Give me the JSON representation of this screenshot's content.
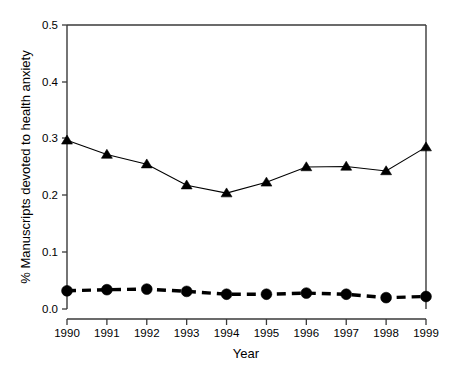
{
  "chart_data": {
    "type": "line",
    "title": "",
    "subtitle": "",
    "xlabel": "Year",
    "ylabel": "% Manuscripts devoted to health anxiety",
    "categories": [
      "1990",
      "1991",
      "1992",
      "1993",
      "1994",
      "1995",
      "1996",
      "1997",
      "1998",
      "1999"
    ],
    "x": [
      1990,
      1991,
      1992,
      1993,
      1994,
      1995,
      1996,
      1997,
      1998,
      1999
    ],
    "xlim": [
      1990,
      1999
    ],
    "ylim": [
      0.0,
      0.5
    ],
    "ytick_labels": [
      "0.0",
      "0.1",
      "0.2",
      "0.3",
      "0.4",
      "0.5"
    ],
    "ytick_values": [
      0.0,
      0.1,
      0.2,
      0.3,
      0.4,
      0.5
    ],
    "xtick_labels": [
      "1990",
      "1991",
      "1992",
      "1993",
      "1994",
      "1995",
      "1996",
      "1997",
      "1998",
      "1999"
    ],
    "grid": false,
    "legend": "none",
    "series": [
      {
        "name": "triangle-series",
        "marker": "triangle",
        "line_style": "solid",
        "line_width": "thin",
        "color": "#000000",
        "values": [
          0.297,
          0.272,
          0.255,
          0.218,
          0.204,
          0.223,
          0.25,
          0.251,
          0.243,
          0.285
        ]
      },
      {
        "name": "circle-series",
        "marker": "circle",
        "line_style": "dashed",
        "line_width": "thick",
        "color": "#000000",
        "values": [
          0.032,
          0.034,
          0.035,
          0.031,
          0.026,
          0.026,
          0.028,
          0.026,
          0.02,
          0.022
        ]
      }
    ]
  },
  "axes": {
    "x_axis_title": "Year",
    "y_axis_title": "% Manuscripts devoted to health anxiety"
  }
}
